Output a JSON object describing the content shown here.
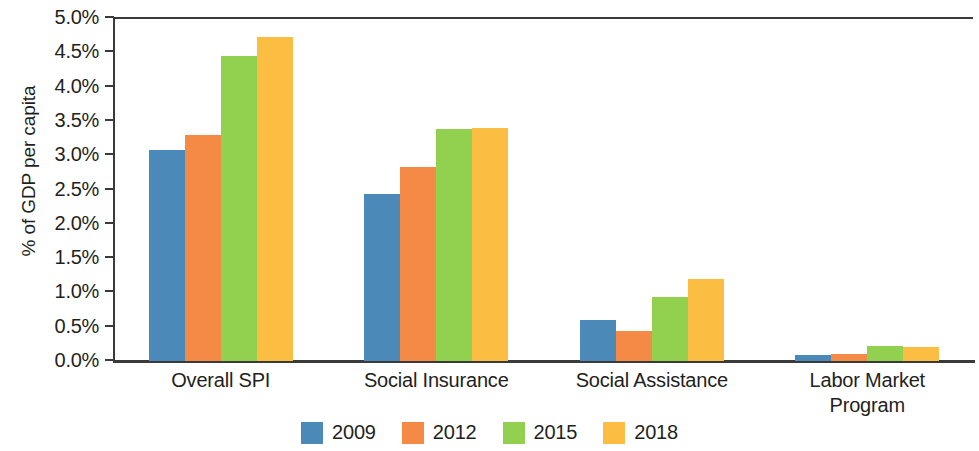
{
  "chart_data": {
    "type": "bar",
    "title": "",
    "subtitle": "",
    "xlabel": "",
    "ylabel": "% of GDP per capita",
    "categories": [
      "Overall SPI",
      "Social Insurance",
      "Social Assistance",
      "Labor Market Program"
    ],
    "category_lines": [
      [
        "Overall SPI"
      ],
      [
        "Social Insurance"
      ],
      [
        "Social Assistance"
      ],
      [
        "Labor Market",
        "Program"
      ]
    ],
    "series": [
      {
        "name": "2009",
        "color": "#4a89b8",
        "values": [
          3.08,
          2.43,
          0.6,
          0.09
        ]
      },
      {
        "name": "2012",
        "color": "#f58a46",
        "values": [
          3.3,
          2.83,
          0.44,
          0.1
        ]
      },
      {
        "name": "2015",
        "color": "#92d14f",
        "values": [
          4.44,
          3.38,
          0.93,
          0.22
        ]
      },
      {
        "name": "2018",
        "color": "#fbbe42",
        "values": [
          4.72,
          3.39,
          1.2,
          0.21
        ]
      }
    ],
    "ylim": [
      0,
      5
    ],
    "ytick_values": [
      0.0,
      0.5,
      1.0,
      1.5,
      2.0,
      2.5,
      3.0,
      3.5,
      4.0,
      4.5,
      5.0
    ],
    "ytick_labels": [
      "0.0%",
      "0.5%",
      "1.0%",
      "1.5%",
      "2.0%",
      "2.5%",
      "3.0%",
      "3.5%",
      "4.0%",
      "4.5%",
      "5.0%"
    ],
    "grid": false,
    "legend_position": "bottom",
    "legend_entries": [
      "2009",
      "2012",
      "2015",
      "2018"
    ],
    "axis_color": "#3a3a3a",
    "text_color": "#231f20",
    "background": "#ffffff"
  }
}
